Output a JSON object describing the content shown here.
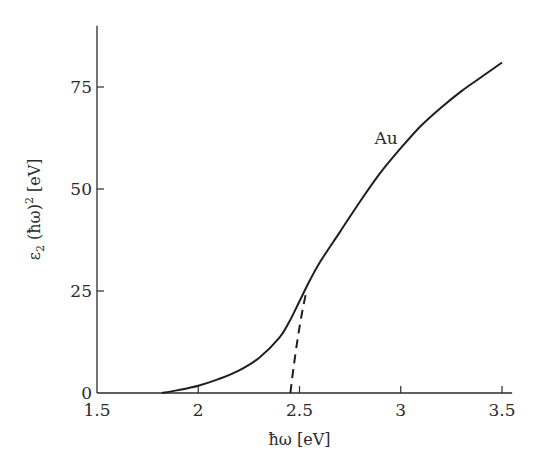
{
  "chart_data": {
    "type": "line",
    "title": "",
    "xlabel": "ħω [eV]",
    "ylabel_parts": {
      "base": "ε",
      "sub": "2",
      "mid": " (ħω)",
      "sup": "2",
      "end": " [eV]"
    },
    "ylabel": "ε2 (ħω)^2 [eV]",
    "xlim": [
      1.5,
      3.55
    ],
    "ylim": [
      0,
      90
    ],
    "xticks": [
      1.5,
      2,
      2.5,
      3,
      3.5
    ],
    "xtick_labels": [
      "1.5",
      "2",
      "2.5",
      "3",
      "3.5"
    ],
    "yticks": [
      0,
      25,
      50,
      75
    ],
    "ytick_labels": [
      "0",
      "25",
      "50",
      "75"
    ],
    "grid": false,
    "legend": "none",
    "series": [
      {
        "name": "Au",
        "style": "solid",
        "x": [
          1.82,
          1.9,
          2.0,
          2.1,
          2.2,
          2.3,
          2.4,
          2.45,
          2.5,
          2.55,
          2.6,
          2.7,
          2.8,
          2.9,
          3.0,
          3.1,
          3.2,
          3.3,
          3.4,
          3.5
        ],
        "y": [
          0,
          0.7,
          1.8,
          3.4,
          5.5,
          8.6,
          13.5,
          17.5,
          22.5,
          27.5,
          32,
          39.5,
          47,
          54,
          60,
          65.5,
          70,
          74,
          77.5,
          81
        ]
      },
      {
        "name": "Au extrapolation",
        "style": "dashed",
        "x": [
          2.455,
          2.47,
          2.49,
          2.51,
          2.53
        ],
        "y": [
          0,
          6,
          13,
          19,
          24
        ]
      }
    ],
    "annotations": [
      {
        "text": "Au",
        "x": 2.87,
        "y": 61
      }
    ]
  }
}
